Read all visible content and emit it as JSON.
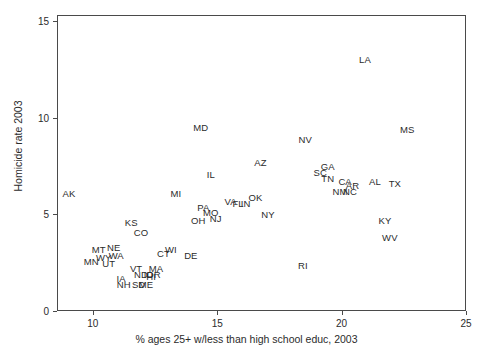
{
  "chart_data": {
    "type": "scatter",
    "title": "",
    "xlabel": "% ages 25+ w/less than high school educ, 2003",
    "ylabel": "Homicide rate 2003",
    "xlim": [
      8.56,
      25.0
    ],
    "ylim": [
      0.0,
      15.3
    ],
    "xticks": [
      10,
      15,
      20,
      25
    ],
    "yticks": [
      0,
      5,
      10,
      15
    ],
    "xtick_labels": [
      "10",
      "15",
      "20",
      "25"
    ],
    "ytick_labels": [
      "0",
      "5",
      "10",
      "15"
    ],
    "grid": false,
    "legend": false,
    "marker_style": "text-label",
    "point_color": "#2b2b2b",
    "frame_color": "#4a4a4a",
    "background_color": "#ffffff",
    "points": [
      {
        "label": "AK",
        "x": 9.0,
        "y": 6.1
      },
      {
        "label": "MN",
        "x": 9.9,
        "y": 2.6
      },
      {
        "label": "MT",
        "x": 10.2,
        "y": 3.2
      },
      {
        "label": "WY",
        "x": 10.4,
        "y": 2.8
      },
      {
        "label": "UT",
        "x": 10.6,
        "y": 2.5
      },
      {
        "label": "NE",
        "x": 10.8,
        "y": 3.3
      },
      {
        "label": "WA",
        "x": 10.9,
        "y": 2.9
      },
      {
        "label": "IA",
        "x": 11.1,
        "y": 1.7
      },
      {
        "label": "NH",
        "x": 11.2,
        "y": 1.4
      },
      {
        "label": "KS",
        "x": 11.5,
        "y": 4.6
      },
      {
        "label": "VT",
        "x": 11.7,
        "y": 2.2
      },
      {
        "label": "SD",
        "x": 11.8,
        "y": 1.4
      },
      {
        "label": "CO",
        "x": 11.9,
        "y": 4.1
      },
      {
        "label": "ND",
        "x": 11.9,
        "y": 1.9
      },
      {
        "label": "ME",
        "x": 12.1,
        "y": 1.4
      },
      {
        "label": "ID",
        "x": 12.2,
        "y": 1.9
      },
      {
        "label": "HI",
        "x": 12.3,
        "y": 1.8
      },
      {
        "label": "OR",
        "x": 12.4,
        "y": 1.9
      },
      {
        "label": "MA",
        "x": 12.5,
        "y": 2.2
      },
      {
        "label": "CT",
        "x": 12.8,
        "y": 3.0
      },
      {
        "label": "WI",
        "x": 13.1,
        "y": 3.2
      },
      {
        "label": "MI",
        "x": 13.3,
        "y": 6.1
      },
      {
        "label": "DE",
        "x": 13.9,
        "y": 2.9
      },
      {
        "label": "OH",
        "x": 14.2,
        "y": 4.7
      },
      {
        "label": "MD",
        "x": 14.3,
        "y": 9.5
      },
      {
        "label": "PA",
        "x": 14.4,
        "y": 5.4
      },
      {
        "label": "MO",
        "x": 14.7,
        "y": 5.1
      },
      {
        "label": "IL",
        "x": 14.7,
        "y": 7.1
      },
      {
        "label": "NJ",
        "x": 14.9,
        "y": 4.8
      },
      {
        "label": "VA",
        "x": 15.5,
        "y": 5.7
      },
      {
        "label": "FL",
        "x": 15.8,
        "y": 5.6
      },
      {
        "label": "IN",
        "x": 16.1,
        "y": 5.6
      },
      {
        "label": "OK",
        "x": 16.5,
        "y": 5.9
      },
      {
        "label": "AZ",
        "x": 16.7,
        "y": 7.7
      },
      {
        "label": "NY",
        "x": 17.0,
        "y": 5.0
      },
      {
        "label": "RI",
        "x": 18.4,
        "y": 2.4
      },
      {
        "label": "NV",
        "x": 18.5,
        "y": 8.9
      },
      {
        "label": "SC",
        "x": 19.1,
        "y": 7.2
      },
      {
        "label": "GA",
        "x": 19.4,
        "y": 7.5
      },
      {
        "label": "TN",
        "x": 19.4,
        "y": 6.9
      },
      {
        "label": "NM",
        "x": 19.9,
        "y": 6.2
      },
      {
        "label": "CA",
        "x": 20.1,
        "y": 6.7
      },
      {
        "label": "NC",
        "x": 20.3,
        "y": 6.2
      },
      {
        "label": "AR",
        "x": 20.4,
        "y": 6.5
      },
      {
        "label": "LA",
        "x": 20.9,
        "y": 13.0
      },
      {
        "label": "AL",
        "x": 21.3,
        "y": 6.7
      },
      {
        "label": "KY",
        "x": 21.7,
        "y": 4.7
      },
      {
        "label": "WV",
        "x": 21.9,
        "y": 3.8
      },
      {
        "label": "TX",
        "x": 22.1,
        "y": 6.6
      },
      {
        "label": "MS",
        "x": 22.6,
        "y": 9.4
      }
    ]
  },
  "axes": {
    "x_label": "% ages 25+ w/less than high school educ, 2003",
    "y_label": "Homicide rate 2003"
  }
}
